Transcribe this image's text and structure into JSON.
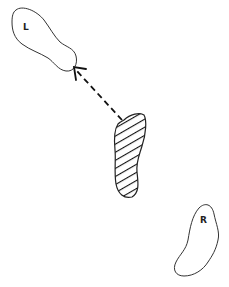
{
  "diagram": {
    "left_foot": {
      "label": "L",
      "style": "outline"
    },
    "right_foot": {
      "label": "R",
      "style": "outline"
    },
    "current_foot": {
      "style": "hatched"
    },
    "arrow": {
      "style": "dashed",
      "direction": "toward-left-foot"
    },
    "colors": {
      "stroke": "#222222",
      "background": "#ffffff"
    }
  }
}
